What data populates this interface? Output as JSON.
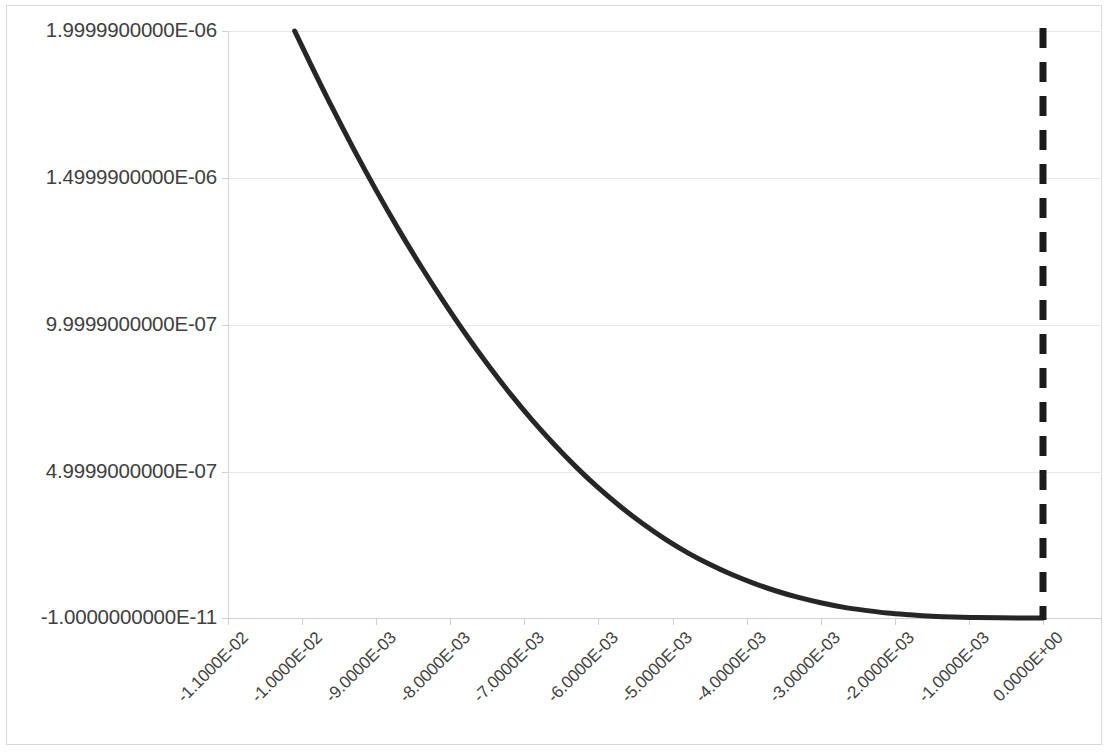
{
  "chart_data": {
    "type": "line",
    "title": "",
    "subtitle": "",
    "xlabel": "",
    "ylabel": "",
    "grid": true,
    "legend": false,
    "legend_position": "none",
    "x_tick_labels": [
      "-1.1000E-02",
      "-1.0000E-02",
      "-9.0000E-03",
      "-8.0000E-03",
      "-7.0000E-03",
      "-6.0000E-03",
      "-5.0000E-03",
      "-4.0000E-03",
      "-3.0000E-03",
      "-2.0000E-03",
      "-1.0000E-03",
      "0.0000E+00"
    ],
    "x_tick_values": [
      -0.011,
      -0.01,
      -0.009,
      -0.008,
      -0.007,
      -0.006,
      -0.005,
      -0.004,
      -0.003,
      -0.002,
      -0.001,
      0.0
    ],
    "y_tick_labels": [
      "1.9999900000E-06",
      "1.4999900000E-06",
      "9.9999000000E-07",
      "4.9999000000E-07",
      "-1.0000000000E-11"
    ],
    "y_tick_values": [
      1.99999e-06,
      1.49999e-06,
      9.9999e-07,
      4.9999e-07,
      -1e-11
    ],
    "xlim": [
      -0.011,
      0.0
    ],
    "ylim": [
      -1e-11,
      1.99999e-06
    ],
    "series": [
      {
        "name": "decay-curve",
        "type": "line",
        "color": "#262626",
        "linewidth": 5,
        "linestyle": "solid",
        "x": [
          -0.0101,
          -0.0099,
          -0.0096,
          -0.0093,
          -0.009,
          -0.0087,
          -0.0084,
          -0.0081,
          -0.0078,
          -0.0075,
          -0.0072,
          -0.0069,
          -0.0066,
          -0.0063,
          -0.006,
          -0.0057,
          -0.0054,
          -0.0051,
          -0.0048,
          -0.0045,
          -0.0042,
          -0.0039,
          -0.0036,
          -0.0033,
          -0.003,
          -0.0027,
          -0.0024,
          -0.0021,
          -0.0018,
          -0.0015,
          -0.0012,
          -0.0009,
          -0.0006,
          -0.0003,
          0.0
        ],
        "y": [
          1.99999e-06,
          1.895e-06,
          1.742e-06,
          1.596e-06,
          1.457e-06,
          1.325e-06,
          1.2e-06,
          1.082e-06,
          9.7e-07,
          8.65e-07,
          7.67e-07,
          6.76e-07,
          5.92e-07,
          5.14e-07,
          4.43e-07,
          3.79e-07,
          3.21e-07,
          2.69e-07,
          2.23e-07,
          1.83e-07,
          1.48e-07,
          1.18e-07,
          9.2e-08,
          7e-08,
          5.2e-08,
          3.7e-08,
          2.6e-08,
          1.7e-08,
          1.1e-08,
          6e-09,
          3e-09,
          1.5e-09,
          5e-10,
          1e-10,
          -1e-11
        ]
      }
    ],
    "annotations": [
      {
        "name": "zero-marker-line",
        "type": "vertical-line",
        "x": 0.0,
        "linestyle": "dashed",
        "color": "#1a1a1a",
        "linewidth": 7,
        "label": ""
      }
    ],
    "colors": {
      "curve": "#262626",
      "marker_line": "#1a1a1a",
      "gridline": "#e8e8e8",
      "axis": "#d9d9d9",
      "tick_text": "#404040",
      "frame": "#d9d9d9",
      "background": "#ffffff"
    }
  }
}
